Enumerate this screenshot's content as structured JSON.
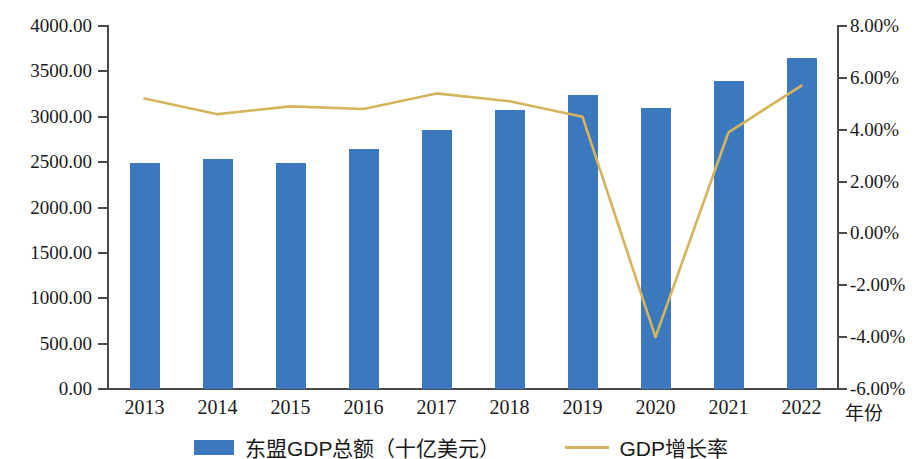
{
  "chart_data": {
    "type": "bar",
    "title": "",
    "subtitle": "",
    "xlabel": "年份",
    "ylabel_left": "",
    "ylabel_right": "",
    "categories": [
      "2013",
      "2014",
      "2015",
      "2016",
      "2017",
      "2018",
      "2019",
      "2020",
      "2021",
      "2022"
    ],
    "grid": false,
    "legend_position": "bottom",
    "y_left": {
      "min": 0,
      "max": 4000,
      "step": 500,
      "ticks": [
        "0.00",
        "500.00",
        "1000.00",
        "1500.00",
        "2000.00",
        "2500.00",
        "3000.00",
        "3500.00",
        "4000.00"
      ]
    },
    "y_right": {
      "min": -6,
      "max": 8,
      "step": 2,
      "ticks": [
        "-6.00%",
        "-4.00%",
        "-2.00%",
        "0.00%",
        "2.00%",
        "4.00%",
        "6.00%",
        "8.00%"
      ]
    },
    "series": [
      {
        "name": "东盟GDP总额（十亿美元）",
        "type": "bar",
        "axis": "left",
        "color": "#3B78BE",
        "values": [
          2490,
          2535,
          2495,
          2645,
          2850,
          3070,
          3245,
          3100,
          3390,
          3645
        ]
      },
      {
        "name": "GDP增长率",
        "type": "line",
        "axis": "right",
        "color": "#D6B45C",
        "values": [
          5.2,
          4.6,
          4.9,
          4.8,
          5.4,
          5.1,
          4.5,
          -4.0,
          3.9,
          5.7
        ]
      }
    ]
  },
  "legend": {
    "bar_label": "东盟GDP总额（十亿美元）",
    "line_label": "GDP增长率"
  },
  "axes": {
    "x_title": "年份"
  }
}
